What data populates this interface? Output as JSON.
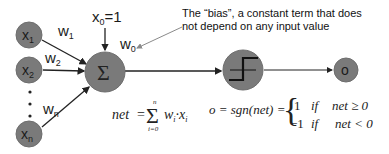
{
  "colors": {
    "node_fill": "#7a7a7a",
    "node_stroke": "#6e6e6e",
    "arrow": "#222222",
    "annotation_arrow": "#8a8a8a",
    "background": "#ffffff"
  },
  "inputs": [
    {
      "label": "x",
      "sub": "1",
      "weight": "w",
      "weight_sub": "1"
    },
    {
      "label": "x",
      "sub": "2",
      "weight": "w",
      "weight_sub": "2"
    },
    {
      "label": "x",
      "sub": "n",
      "weight": "w",
      "weight_sub": "n"
    }
  ],
  "bias": {
    "input_label": "x",
    "input_sub": "0",
    "input_value": "=1",
    "weight": "w",
    "weight_sub": "0",
    "annotation_line1": "The “bias”, a constant term that does",
    "annotation_line2": "not depend on any input value"
  },
  "sum_node": {
    "symbol": "Σ"
  },
  "activation_node": {
    "icon": "step-function-icon"
  },
  "output_node": {
    "label": "o"
  },
  "equations": {
    "net_lhs": "net",
    "net_eq": "=",
    "net_sigma": "Σ",
    "net_upper": "n",
    "net_lower": "i=0",
    "net_rhs_w": "w",
    "net_rhs_wsub": "i",
    "net_dot": "·",
    "net_rhs_x": "x",
    "net_rhs_xsub": "i",
    "o_lhs": "o = sgn(",
    "o_net": "net",
    "o_close": ") =",
    "case1_value": "1",
    "case1_if": "if",
    "case1_cond": "net ≥ 0",
    "case2_value": "−1",
    "case2_if": "if",
    "case2_cond": "net < 0"
  }
}
